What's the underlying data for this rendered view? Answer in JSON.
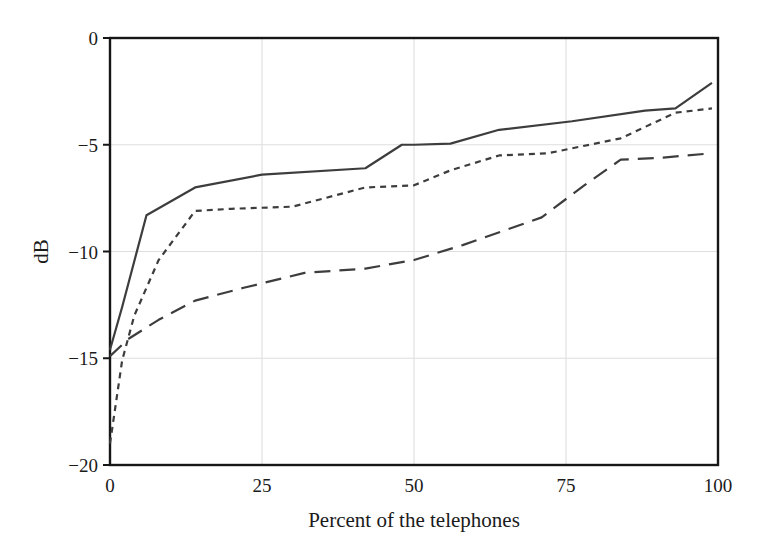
{
  "chart_data": {
    "type": "line",
    "title": "",
    "subtitle": "",
    "xlabel": "Percent of the telephones",
    "ylabel": "dB",
    "xlim": [
      0,
      100
    ],
    "ylim": [
      -20,
      0
    ],
    "xticks": [
      0,
      25,
      50,
      75,
      100
    ],
    "xtick_labels": [
      "0",
      "25",
      "50",
      "75",
      "100"
    ],
    "yticks": [
      0,
      -5,
      -10,
      -15,
      -20
    ],
    "ytick_labels": [
      "0",
      "−5",
      "−10",
      "−15",
      "−20"
    ],
    "grid": true,
    "grid_color": "#dedede",
    "legend": null,
    "legend_position": "none",
    "line_color": "#3d3d3d",
    "frame_color": "#161616",
    "background": "#ffffff",
    "series": [
      {
        "name": "solid",
        "style": "solid",
        "dash": "none",
        "x": [
          0,
          2,
          6,
          14,
          25,
          42,
          48,
          50,
          56,
          64,
          76,
          88,
          93,
          99
        ],
        "y": [
          -14.6,
          -12.6,
          -8.3,
          -7.0,
          -6.4,
          -6.1,
          -5.0,
          -5.0,
          -4.95,
          -4.3,
          -3.9,
          -3.4,
          -3.3,
          -2.1
        ]
      },
      {
        "name": "short-dashed",
        "style": "dashed",
        "dash": "6,5",
        "x": [
          0,
          2,
          4,
          8,
          14,
          20,
          30,
          42,
          50,
          56,
          64,
          72,
          84,
          93,
          99
        ],
        "y": [
          -19.0,
          -15.1,
          -13.0,
          -10.4,
          -8.1,
          -8.0,
          -7.9,
          -7.0,
          -6.9,
          -6.2,
          -5.5,
          -5.4,
          -4.7,
          -3.5,
          -3.3
        ]
      },
      {
        "name": "long-dashed",
        "style": "long-dashed",
        "dash": "16,9",
        "x": [
          0,
          3,
          8,
          14,
          22,
          32,
          42,
          50,
          58,
          65,
          71,
          78,
          84,
          91,
          99
        ],
        "y": [
          -14.9,
          -14.1,
          -13.2,
          -12.3,
          -11.7,
          -11.0,
          -10.8,
          -10.4,
          -9.7,
          -9.0,
          -8.4,
          -6.9,
          -5.7,
          -5.6,
          -5.4
        ]
      }
    ]
  },
  "axes": {
    "x_title": "Percent of the telephones",
    "y_title": "dB"
  }
}
